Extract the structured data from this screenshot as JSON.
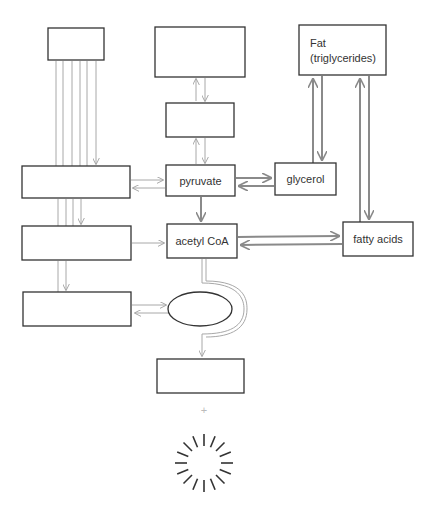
{
  "diagram": {
    "title": "",
    "nodes": {
      "top_left_box": {
        "label": ""
      },
      "top_middle_box": {
        "label": ""
      },
      "middle_box": {
        "label": ""
      },
      "fat": {
        "line1": "Fat",
        "line2": "(triglycerides)"
      },
      "left_box_1": {
        "label": ""
      },
      "pyruvate": {
        "label": "pyruvate"
      },
      "glycerol": {
        "label": "glycerol"
      },
      "left_box_2": {
        "label": ""
      },
      "acetyl_coa": {
        "label": "acetyl CoA"
      },
      "fatty_acids": {
        "label": "fatty acids"
      },
      "left_box_3": {
        "label": ""
      },
      "cycle_ellipse": {
        "label": ""
      },
      "bottom_box": {
        "label": ""
      },
      "plus_sign": {
        "label": "+"
      }
    },
    "edges": [
      {
        "from": "top_left_box",
        "to": "left_box_1",
        "style": "thin",
        "count": 6
      },
      {
        "from": "left_box_1",
        "to": "left_box_2",
        "style": "thin",
        "count": 3
      },
      {
        "from": "left_box_2",
        "to": "left_box_3",
        "style": "thin",
        "count": 2
      },
      {
        "from": "top_middle_box",
        "to": "middle_box",
        "style": "thin",
        "bidirectional": true
      },
      {
        "from": "middle_box",
        "to": "pyruvate",
        "style": "thin",
        "bidirectional": true
      },
      {
        "from": "left_box_1",
        "to": "pyruvate",
        "style": "thin",
        "bidirectional": true
      },
      {
        "from": "pyruvate",
        "to": "glycerol",
        "style": "thick",
        "bidirectional": true
      },
      {
        "from": "glycerol",
        "to": "fat",
        "style": "thick",
        "bidirectional": true
      },
      {
        "from": "fat",
        "to": "fatty_acids",
        "style": "thick",
        "bidirectional": true
      },
      {
        "from": "pyruvate",
        "to": "acetyl_coa",
        "style": "thick"
      },
      {
        "from": "left_box_2",
        "to": "acetyl_coa",
        "style": "thin"
      },
      {
        "from": "acetyl_coa",
        "to": "fatty_acids",
        "style": "thick",
        "bidirectional": true
      },
      {
        "from": "left_box_3",
        "to": "cycle_ellipse",
        "style": "thin",
        "bidirectional": true
      },
      {
        "from": "acetyl_coa",
        "to": "bottom_box",
        "style": "thin",
        "via": "loop around ellipse"
      }
    ],
    "decorations": [
      "sunburst-energy-icon"
    ]
  }
}
